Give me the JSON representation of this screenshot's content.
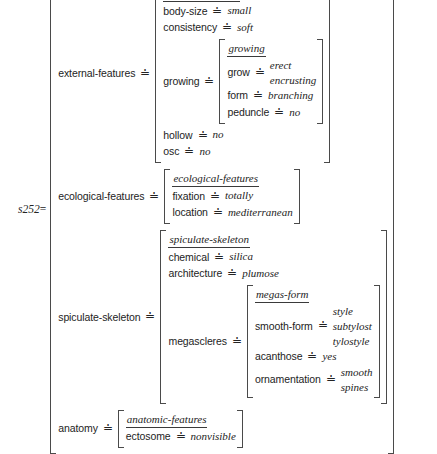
{
  "diagram": {
    "kind": "attribute-value-matrix",
    "root_label": "s252",
    "root_equals": "=",
    "relation_symbol": "≐",
    "colors": {
      "text": "#232323",
      "bracket": "#4a4a4a",
      "rule": "#3a3a3a",
      "background": "#ffffff"
    }
  },
  "sponge": {
    "type": "sponge",
    "external_features": {
      "attr": "external-features",
      "type": "external-features",
      "body_size": {
        "attr": "body-size",
        "value": "small"
      },
      "consistency": {
        "attr": "consistency",
        "value": "soft"
      },
      "growing": {
        "attr": "growing",
        "type": "growing",
        "grow": {
          "attr": "grow",
          "values": [
            "erect",
            "encrusting"
          ]
        },
        "form": {
          "attr": "form",
          "value": "branching"
        },
        "peduncle": {
          "attr": "peduncle",
          "value": "no"
        }
      },
      "hollow": {
        "attr": "hollow",
        "value": "no"
      },
      "osc": {
        "attr": "osc",
        "value": "no"
      }
    },
    "ecological_features": {
      "attr": "ecological-features",
      "type": "ecological-features",
      "fixation": {
        "attr": "fixation",
        "value": "totally"
      },
      "location": {
        "attr": "location",
        "value": "mediterranean"
      }
    },
    "spiculate_skeleton": {
      "attr": "spiculate-skeleton",
      "type": "spiculate-skeleton",
      "chemical": {
        "attr": "chemical",
        "value": "silica"
      },
      "architecture": {
        "attr": "architecture",
        "value": "plumose"
      },
      "megascleres": {
        "attr": "megascleres",
        "type": "megas-form",
        "smooth_form": {
          "attr": "smooth-form",
          "values": [
            "style",
            "subtylost",
            "tylostyle"
          ]
        },
        "acanthose": {
          "attr": "acanthose",
          "value": "yes"
        },
        "ornamentation": {
          "attr": "ornamentation",
          "values": [
            "smooth",
            "spines"
          ]
        }
      }
    },
    "anatomy": {
      "attr": "anatomy",
      "type": "anatomic-features",
      "ectosome": {
        "attr": "ectosome",
        "value": "nonvisible"
      }
    }
  }
}
